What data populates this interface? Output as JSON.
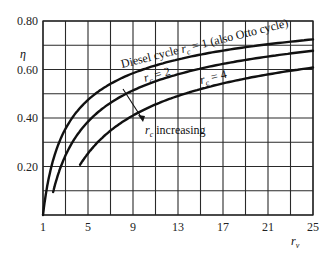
{
  "chart_data": {
    "type": "line",
    "title": "",
    "xlabel": "r_v",
    "ylabel": "η",
    "xlim": [
      1,
      25
    ],
    "ylim": [
      0,
      0.8
    ],
    "x_ticks": [
      1,
      5,
      9,
      13,
      17,
      21,
      25
    ],
    "y_ticks": [
      0.2,
      0.4,
      0.6,
      0.8
    ],
    "y_tick_labels": [
      "0.20",
      "0.40",
      "0.60",
      "0.80"
    ],
    "grid": true,
    "grid_x_step": 2,
    "grid_y_step": 0.1,
    "series": [
      {
        "name": "Diesel cycle r_c = 1 (also Otto cycle)",
        "x": [
          1,
          2,
          3,
          5,
          7,
          9,
          13,
          17,
          21,
          25
        ],
        "values": [
          0.0,
          0.24,
          0.36,
          0.47,
          0.54,
          0.58,
          0.64,
          0.68,
          0.7,
          0.72
        ]
      },
      {
        "name": "r_c = 2",
        "x": [
          1.9,
          3,
          5,
          7,
          9,
          13,
          17,
          21,
          25
        ],
        "values": [
          0.12,
          0.26,
          0.39,
          0.46,
          0.51,
          0.58,
          0.62,
          0.65,
          0.68
        ]
      },
      {
        "name": "r_c = 4",
        "x": [
          4.3,
          5,
          7,
          9,
          13,
          17,
          21,
          25
        ],
        "values": [
          0.19,
          0.24,
          0.34,
          0.4,
          0.48,
          0.53,
          0.57,
          0.61
        ]
      }
    ],
    "annotations": [
      {
        "text": "r_c increasing",
        "arrow": "points from r_c=1 curve toward r_c=4 curve"
      }
    ]
  },
  "labels": {
    "y_axis": "η",
    "x_axis_main": "r",
    "x_axis_sub": "v",
    "curve1_a": "Diesel cycle ",
    "curve1_r": "r",
    "curve1_sub": "c",
    "curve1_b": " = 1 (also Otto cycle)",
    "curve2_r": "r",
    "curve2_sub": "c",
    "curve2_b": " = 2",
    "curve3_r": "r",
    "curve3_sub": "c",
    "curve3_b": " = 4",
    "arrow_r": "r",
    "arrow_sub": "c",
    "arrow_text": " increasing"
  }
}
